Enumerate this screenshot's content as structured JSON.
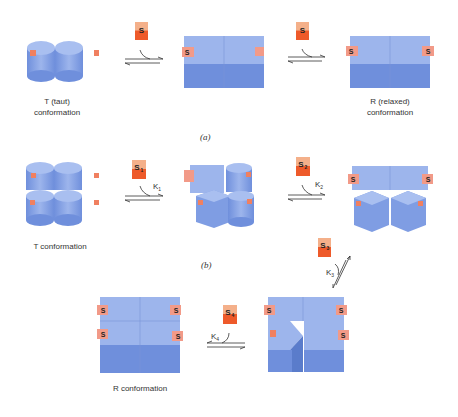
{
  "diagram": {
    "panels": [
      {
        "id": "a",
        "label": "(a)",
        "states": [
          {
            "name": "T (taut)",
            "sub": "conformation",
            "bound": 0
          },
          {
            "name": "",
            "sub": "",
            "bound": 1
          },
          {
            "name": "R (relaxed)",
            "sub": "conformation",
            "bound": 2
          }
        ],
        "ligands": [
          "S",
          "S"
        ]
      },
      {
        "id": "b",
        "label": "(b)",
        "states": [
          {
            "name": "T conformation",
            "bound": 0
          },
          {
            "name": "",
            "bound": 1
          },
          {
            "name": "",
            "bound": 2
          },
          {
            "name": "",
            "bound": 3
          },
          {
            "name": "R conformation",
            "bound": 4
          }
        ],
        "ligands": [
          {
            "label": "S",
            "sub": "1",
            "constant": "K",
            "csub": "1"
          },
          {
            "label": "S",
            "sub": "2",
            "constant": "K",
            "csub": "2"
          },
          {
            "label": "S",
            "sub": "3",
            "constant": "K",
            "csub": "3"
          },
          {
            "label": "S",
            "sub": "4",
            "constant": "K",
            "csub": "4"
          }
        ]
      }
    ],
    "site_label": "S",
    "colors": {
      "subunit_top": "#9db5ec",
      "subunit_side": "#6f8fdc",
      "site": "#f29a88",
      "ligand_top": "#f4b08a",
      "ligand_side": "#ee5a2a",
      "text": "#333333"
    }
  }
}
